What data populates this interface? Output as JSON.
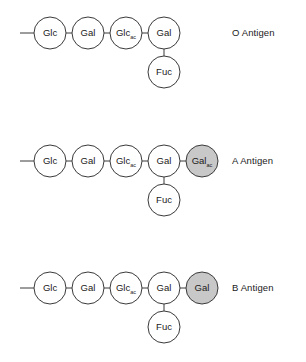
{
  "figure": {
    "type": "glycan-structure-diagram",
    "background_color": "#ffffff",
    "stroke_color": "#3a3a3a",
    "shaded_fill_color": "#c8c8c8",
    "plain_fill_color": "#ffffff",
    "text_color": "#1a1a1a"
  },
  "geometry": {
    "circle_radius": 16,
    "chain_x": [
      50,
      88,
      126,
      164,
      202
    ],
    "stub_x_start": 20,
    "branch_offset_y": 39,
    "row_y": [
      33,
      161,
      288
    ],
    "label_x": 232
  },
  "rows": [
    {
      "id": "o-antigen",
      "label": "O Antigen",
      "label_y": 27,
      "chain_y": 33,
      "branch_y": 72,
      "branch_index": 3,
      "has_leading_stub": true,
      "nodes": [
        {
          "name": "Glc",
          "base": "Glc",
          "sub": "",
          "shaded": false
        },
        {
          "name": "Gal",
          "base": "Gal",
          "sub": "",
          "shaded": false
        },
        {
          "name": "GlcAc",
          "base": "Glc",
          "sub": "ac",
          "shaded": false
        },
        {
          "name": "Gal",
          "base": "Gal",
          "sub": "",
          "shaded": false
        }
      ],
      "branch_node": {
        "name": "Fuc",
        "base": "Fuc",
        "sub": "",
        "shaded": false
      }
    },
    {
      "id": "a-antigen",
      "label": "A Antigen",
      "label_y": 155,
      "chain_y": 161,
      "branch_y": 200,
      "branch_index": 3,
      "has_leading_stub": true,
      "nodes": [
        {
          "name": "Glc",
          "base": "Glc",
          "sub": "",
          "shaded": false
        },
        {
          "name": "Gal",
          "base": "Gal",
          "sub": "",
          "shaded": false
        },
        {
          "name": "GlcAc",
          "base": "Glc",
          "sub": "ac",
          "shaded": false
        },
        {
          "name": "Gal",
          "base": "Gal",
          "sub": "",
          "shaded": false
        },
        {
          "name": "GalAc",
          "base": "Gal",
          "sub": "ac",
          "shaded": true
        }
      ],
      "branch_node": {
        "name": "Fuc",
        "base": "Fuc",
        "sub": "",
        "shaded": false
      }
    },
    {
      "id": "b-antigen",
      "label": "B Antigen",
      "label_y": 282,
      "chain_y": 288,
      "branch_y": 327,
      "branch_index": 3,
      "has_leading_stub": true,
      "nodes": [
        {
          "name": "Glc",
          "base": "Glc",
          "sub": "",
          "shaded": false
        },
        {
          "name": "Gal",
          "base": "Gal",
          "sub": "",
          "shaded": false
        },
        {
          "name": "GlcAc",
          "base": "Glc",
          "sub": "ac",
          "shaded": false
        },
        {
          "name": "Gal",
          "base": "Gal",
          "sub": "",
          "shaded": false
        },
        {
          "name": "Gal",
          "base": "Gal",
          "sub": "",
          "shaded": true
        }
      ],
      "branch_node": {
        "name": "Fuc",
        "base": "Fuc",
        "sub": "",
        "shaded": false
      }
    }
  ]
}
